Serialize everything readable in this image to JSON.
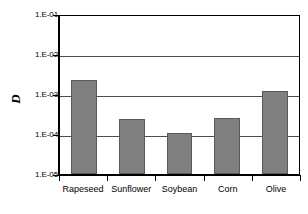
{
  "chart_data": {
    "type": "bar",
    "title": "",
    "xlabel": "",
    "ylabel": "D",
    "yscale": "log",
    "ylim": [
      1e-05,
      0.1
    ],
    "grid": true,
    "legend": false,
    "categories": [
      "Rapeseed",
      "Sunflower",
      "Soybean",
      "Corn",
      "Olive"
    ],
    "values": [
      0.0022,
      0.00024,
      0.000105,
      0.00025,
      0.0012
    ],
    "ytick_labels": [
      "1.E-01",
      "1.E-02",
      "1.E-03",
      "1.E-04",
      "1.E-05"
    ],
    "ytick_values": [
      0.1,
      0.01,
      0.001,
      0.0001,
      1e-05
    ],
    "series": [
      {
        "name": "D",
        "values": [
          0.0022,
          0.00024,
          0.000105,
          0.00025,
          0.0012
        ]
      }
    ],
    "colors": {
      "bar_fill": "#808080",
      "bar_border": "#5a5a5a",
      "gridline": "#4d4d4d",
      "axis": "#000000",
      "background": "#ffffff"
    }
  },
  "axis": {
    "y_title": "D"
  }
}
